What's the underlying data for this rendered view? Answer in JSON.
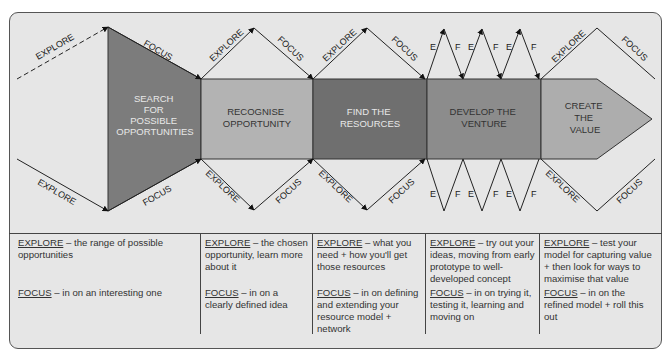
{
  "diagram": {
    "colors": {
      "background": "#e6e6e6",
      "search": "#7c7c7c",
      "recognise": "#b3b3b3",
      "resources": "#6f6f6f",
      "develop": "#8c8c8c",
      "create": "#adadad",
      "line": "#222222"
    },
    "stages": [
      {
        "id": "search",
        "lines": [
          "SEARCH",
          "FOR",
          "POSSIBLE",
          "OPPORTUNITIES"
        ],
        "text_color": "#e8e8e8"
      },
      {
        "id": "recognise",
        "lines": [
          "RECOGNISE",
          "OPPORTUNITY"
        ],
        "text_color": "#333333"
      },
      {
        "id": "resources",
        "lines": [
          "FIND THE",
          "RESOURCES"
        ],
        "text_color": "#e8e8e8"
      },
      {
        "id": "develop",
        "lines": [
          "DEVELOP THE",
          "VENTURE"
        ],
        "text_color": "#333333"
      },
      {
        "id": "create",
        "lines": [
          "CREATE",
          "THE",
          "VALUE"
        ],
        "text_color": "#333333"
      }
    ],
    "arrow_labels": {
      "explore": "EXPLORE",
      "focus": "FOCUS",
      "e": "E",
      "f": "F"
    }
  },
  "descriptions": [
    {
      "explore_kw": "EXPLORE",
      "explore_text": " – the range of possible opportunities",
      "focus_kw": "FOCUS",
      "focus_text": " – in on an interesting one"
    },
    {
      "explore_kw": "EXPLORE",
      "explore_text": " – the chosen opportunity, learn more about it",
      "focus_kw": "FOCUS",
      "focus_text": " – in on a clearly defined idea"
    },
    {
      "explore_kw": "EXPLORE",
      "explore_text": " – what you need + how you'll get those resources",
      "focus_kw": "FOCUS",
      "focus_text": " – in on defining and extending your resource model + network"
    },
    {
      "explore_kw": "EXPLORE",
      "explore_text": " – try out your ideas, moving from early prototype to well-developed concept",
      "focus_kw": "FOCUS",
      "focus_text": " – in on trying it, testing it, learning and moving on"
    },
    {
      "explore_kw": "EXPLORE",
      "explore_text": " – test your model for capturing value + then look for ways to maximise that value",
      "focus_kw": "FOCUS",
      "focus_text": " – in on the refined model + roll this out"
    }
  ]
}
